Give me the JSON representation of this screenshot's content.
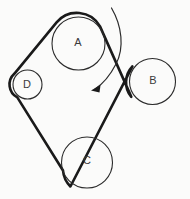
{
  "diagram": {
    "background_color": "#fbfbfa",
    "line_color": "#1a1a1a",
    "outline_color": "#2b2b2b",
    "label_color": "#3a3a3a"
  },
  "pulleys": [
    {
      "id": "A",
      "label": "A",
      "cx": 78.5,
      "cy": 43.5,
      "r": 26.5,
      "label_x": 78,
      "label_y": 43
    },
    {
      "id": "B",
      "label": "B",
      "cx": 152.5,
      "cy": 81.5,
      "r": 23.0,
      "label_x": 153,
      "label_y": 81
    },
    {
      "id": "C",
      "label": "C",
      "cx": 87.0,
      "cy": 162.5,
      "r": 25.5,
      "label_x": 87,
      "label_y": 161
    },
    {
      "id": "D",
      "label": "D",
      "cx": 27.5,
      "cy": 84.5,
      "r": 14.5,
      "label_x": 27,
      "label_y": 85
    }
  ],
  "belt": {
    "name": "crossed-belt",
    "stroke_width": 2.6,
    "path": "M 14.3 73.8 L 56.6 22.3 A 26.5 26.5 0 0 1 100.0 26.4 L 131.3 96.9 A 23 23 0 0 1 132.4 66.4 L 70.4 186.5 A 25.5 25.5 0 0 1 63.0 170.5 L 17.3 97.4 A 14.5 14.5 0 0 1 14.3 73.8 Z",
    "segments": [
      {
        "from": "D",
        "to": "A",
        "type": "straight-tangent"
      },
      {
        "from": "A",
        "to": "B",
        "type": "crossed-straight"
      },
      {
        "from": "B",
        "to": "C",
        "type": "crossed-straight"
      },
      {
        "from": "C",
        "to": "D",
        "type": "straight-tangent"
      }
    ]
  },
  "rotation_arrow": {
    "name": "rotation-direction-arrow",
    "arc_path": "M 111.5 8.0 C 122.0 26.0 124.5 48.0 116.0 64.0 C 109.0 77.5 100.5 85.5 95.0 89.0",
    "head_points": "91.0,90.5 100.5,85.0 99.5,92.5",
    "direction": "counter-clockwise",
    "tip_x": 91,
    "tip_y": 90.5
  }
}
